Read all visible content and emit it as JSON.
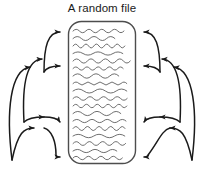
{
  "figure": {
    "title": "A random file",
    "alt_description": "A rounded rectangle representing a file filled with wavy lines of text, with curved arrows on both the left and right sides pointing into the file at four vertical positions on each side",
    "colors": {
      "stroke": "#1a1a1a",
      "file_border": "#4d4d4d",
      "text_squiggle": "#4d4d4d",
      "background": "#ffffff"
    },
    "file_box": {
      "name": "random-file",
      "x": 68,
      "y": 21,
      "width": 68,
      "height": 143,
      "corner_radius": 13,
      "line_count": 18
    },
    "arrows": {
      "left_side_count": 4,
      "right_side_count": 4,
      "left_direction": "right",
      "right_direction": "left",
      "entry_points_y": [
        32,
        72,
        122,
        155
      ]
    }
  }
}
